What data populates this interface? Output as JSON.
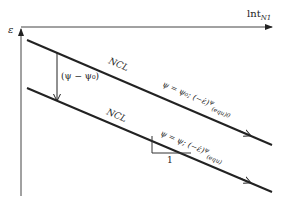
{
  "diagram": {
    "axes": {
      "y_label": "ε",
      "x_label_main": "lnt",
      "x_label_sub": "N1"
    },
    "shift_label": "(ψ − ψ₀)",
    "upper_line": {
      "name": "NCL",
      "equation_main": "ψ = ψ₀; (−ε̇)",
      "equation_sup": "ψ",
      "equation_sub": "(equ)0"
    },
    "lower_line": {
      "name": "NCL",
      "equation_main": "ψ = ψ; (−ε̇)",
      "equation_sup": "ψ",
      "equation_sub": "(equ)"
    },
    "slope_triangle": {
      "run_label": "1"
    },
    "colors": {
      "line": "#222222",
      "axis": "#333333",
      "background": "#ffffff"
    }
  }
}
